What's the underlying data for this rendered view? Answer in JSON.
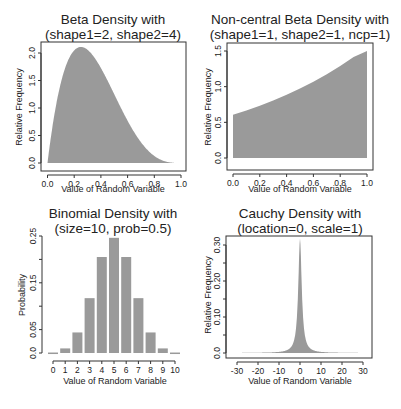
{
  "colors": {
    "fill": "#9a9a9a",
    "axis": "#333333",
    "text": "#222222"
  },
  "chart_data": [
    {
      "id": "beta",
      "type": "area",
      "title": "Beta Density with",
      "subtitle": "(shape1=2, shape2=4)",
      "xlabel": "Value of Random Variable",
      "ylabel": "Relative Frequency",
      "xlim": [
        0,
        1
      ],
      "ylim": [
        0,
        2.0
      ],
      "xticks": [
        0.0,
        0.2,
        0.4,
        0.6,
        0.8,
        1.0
      ],
      "xtick_labels": [
        "0.0",
        "0.2",
        "0.4",
        "0.6",
        "0.8",
        "1.0"
      ],
      "yticks": [
        0.0,
        0.5,
        1.0,
        1.5,
        2.0
      ],
      "ytick_labels": [
        "0.0",
        "0.5",
        "1.0",
        "1.5",
        "2.0"
      ],
      "grid": false,
      "distribution": {
        "name": "beta",
        "shape1": 2,
        "shape2": 4
      },
      "x": [
        0,
        0.05,
        0.1,
        0.15,
        0.2,
        0.25,
        0.3,
        0.35,
        0.4,
        0.45,
        0.5,
        0.55,
        0.6,
        0.65,
        0.7,
        0.75,
        0.8,
        0.85,
        0.9,
        0.95,
        1.0
      ],
      "values": [
        0,
        1.715,
        1.822,
        2.158,
        2.048,
        2.109,
        2.058,
        1.922,
        1.728,
        1.497,
        1.25,
        1.003,
        0.768,
        0.557,
        0.378,
        0.234,
        0.128,
        0.058,
        0.018,
        0.002,
        0
      ]
    },
    {
      "id": "ncbeta",
      "type": "area",
      "title": "Non-central Beta Density with",
      "subtitle": "(shape1=1, shape2=1, ncp=1)",
      "xlabel": "Value of Random Variable",
      "ylabel": "Relative Frequency",
      "xlim": [
        0,
        1
      ],
      "ylim": [
        0,
        1.5
      ],
      "xticks": [
        0.0,
        0.2,
        0.4,
        0.6,
        0.8,
        1.0
      ],
      "xtick_labels": [
        "0.0",
        "0.2",
        "0.4",
        "0.6",
        "0.8",
        "1.0"
      ],
      "yticks": [
        0.0,
        0.5,
        1.0,
        1.5
      ],
      "ytick_labels": [
        "0.0",
        "0.5",
        "1.0",
        "1.5"
      ],
      "grid": false,
      "distribution": {
        "name": "beta",
        "shape1": 1,
        "shape2": 1,
        "ncp": 1
      },
      "x": [
        0,
        0.1,
        0.2,
        0.3,
        0.4,
        0.5,
        0.6,
        0.7,
        0.8,
        0.9,
        1.0
      ],
      "values": [
        0.607,
        0.667,
        0.733,
        0.806,
        0.886,
        0.974,
        1.07,
        1.175,
        1.29,
        1.415,
        1.5
      ]
    },
    {
      "id": "binom",
      "type": "bar",
      "title": "Binomial Density with",
      "subtitle": "(size=10, prob=0.5)",
      "xlabel": "Value of Random Variable",
      "ylabel": "Probability",
      "xlim": [
        0,
        10
      ],
      "ylim": [
        0,
        0.25
      ],
      "categories": [
        "0",
        "1",
        "2",
        "3",
        "4",
        "5",
        "6",
        "7",
        "8",
        "9",
        "10"
      ],
      "values": [
        0.001,
        0.0098,
        0.0439,
        0.1172,
        0.2051,
        0.2461,
        0.2051,
        0.1172,
        0.0439,
        0.0098,
        0.001
      ],
      "yticks": [
        0.0,
        0.05,
        0.1,
        0.15,
        0.2,
        0.25
      ],
      "ytick_labels": [
        "0.0",
        "0.05",
        "",
        "0.15",
        "",
        "0.25"
      ],
      "grid": false,
      "distribution": {
        "name": "binomial",
        "size": 10,
        "prob": 0.5
      }
    },
    {
      "id": "cauchy",
      "type": "area",
      "title": "Cauchy Density with",
      "subtitle": "(location=0, scale=1)",
      "xlabel": "Value of Random Variable",
      "ylabel": "Relative Frequency",
      "xlim": [
        -32,
        32
      ],
      "ylim": [
        0,
        0.32
      ],
      "xticks": [
        -30,
        -20,
        -10,
        0,
        10,
        20,
        30
      ],
      "xtick_labels": [
        "-30",
        "-20",
        "-10",
        "0",
        "10",
        "20",
        "30"
      ],
      "yticks": [
        0.0,
        0.05,
        0.1,
        0.15,
        0.2,
        0.25,
        0.3
      ],
      "ytick_labels": [
        "0.0",
        "",
        "0.10",
        "",
        "0.20",
        "",
        "0.30"
      ],
      "grid": false,
      "distribution": {
        "name": "cauchy",
        "location": 0,
        "scale": 1
      },
      "x": [
        -32,
        -20,
        -10,
        -5,
        -3,
        -2,
        -1,
        -0.5,
        0,
        0.5,
        1,
        2,
        3,
        5,
        10,
        20,
        32
      ],
      "values": [
        0.0003,
        0.0008,
        0.0032,
        0.0122,
        0.0318,
        0.0637,
        0.1592,
        0.2546,
        0.3183,
        0.2546,
        0.1592,
        0.0637,
        0.0318,
        0.0122,
        0.0032,
        0.0008,
        0.0003
      ]
    }
  ]
}
